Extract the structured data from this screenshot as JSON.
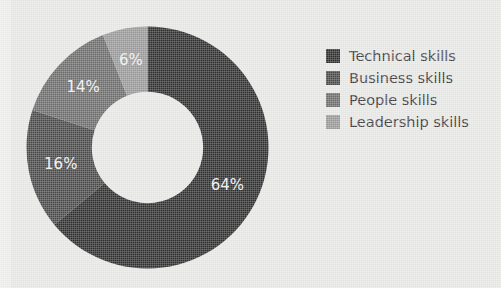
{
  "background_color": "#e8e8e6",
  "chart_data": {
    "type": "pie",
    "variant": "donut",
    "title": "",
    "subtitle": "",
    "xlabel": "",
    "ylabel": "",
    "grid": false,
    "hole_ratio": 0.46,
    "start_angle_deg": -90,
    "direction": "clockwise",
    "legend_position": "right",
    "categories": [
      "Technical skills",
      "Business skills",
      "People skills",
      "Leadership skills"
    ],
    "values": [
      64,
      16,
      14,
      6
    ],
    "value_suffix": "%",
    "colors": [
      "#2f2f2f",
      "#4a4a4a",
      "#6e6e6e",
      "#9a9a9a"
    ],
    "data_labels": [
      "64%",
      "16%",
      "14%",
      "6%"
    ],
    "data_label_color": "#f2f2f0",
    "slices": [
      {
        "name": "Technical skills",
        "value": 64,
        "label": "64%",
        "color": "#2f2f2f"
      },
      {
        "name": "Business skills",
        "value": 16,
        "label": "16%",
        "color": "#4a4a4a"
      },
      {
        "name": "People skills",
        "value": 14,
        "label": "14%",
        "color": "#6e6e6e"
      },
      {
        "name": "Leadership skills",
        "value": 6,
        "label": "6%",
        "color": "#9a9a9a"
      }
    ]
  },
  "legend": {
    "items": [
      {
        "label": "Technical skills",
        "color": "#2f2f2f"
      },
      {
        "label": "Business skills",
        "color": "#4a4a4a"
      },
      {
        "label": "People skills",
        "color": "#6e6e6e"
      },
      {
        "label": "Leadership skills",
        "color": "#9a9a9a"
      }
    ]
  }
}
